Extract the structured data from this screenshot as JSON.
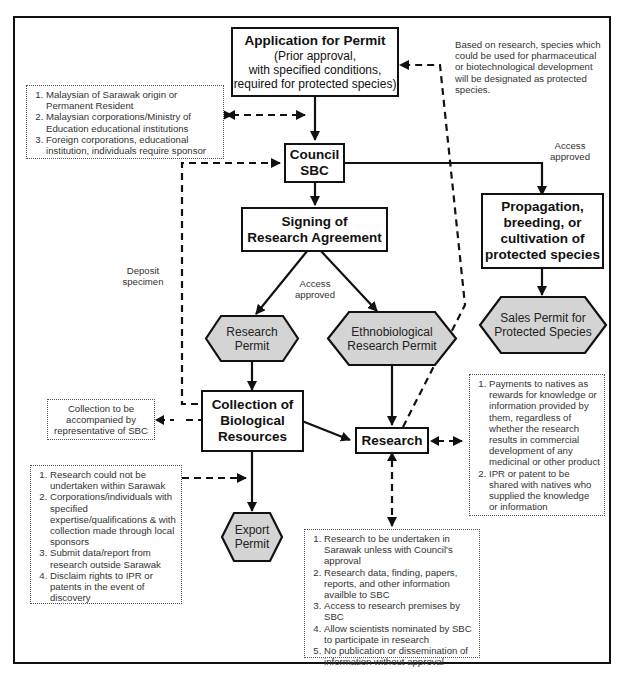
{
  "diagram": {
    "colors": {
      "line": "#111111",
      "hex_fill": "#d4d4d4",
      "note_text": "#333333"
    },
    "nodes": {
      "application": {
        "title": "Application for Permit",
        "subtitle_lines": [
          "(Prior approval,",
          "with specified conditions,",
          "required for protected species)"
        ]
      },
      "council": {
        "line1": "Council",
        "line2": "SBC"
      },
      "signing": {
        "line1": "Signing of",
        "line2": "Research Agreement"
      },
      "propagation": {
        "lines": [
          "Propagation,",
          "breeding, or",
          "cultivation of",
          "protected species"
        ]
      },
      "research_permit": {
        "line1": "Research",
        "line2": "Permit"
      },
      "ethno_permit": {
        "line1": "Ethnobiological",
        "line2": "Research Permit"
      },
      "sales_permit": {
        "line1": "Sales Permit for",
        "line2": "Protected Species"
      },
      "collection": {
        "line1": "Collection of",
        "line2": "Biological",
        "line3": "Resources"
      },
      "research": {
        "label": "Research"
      },
      "export_permit": {
        "line1": "Export",
        "line2": "Permit"
      }
    },
    "labels": {
      "protected_species_note": "Based on research, species which could be used for pharmaceutical or biotechnological development will be designated as protected species.",
      "access_approved_right": {
        "line1": "Access",
        "line2": "approved"
      },
      "access_approved_center": {
        "line1": "Access",
        "line2": "approved"
      },
      "deposit_specimen": {
        "line1": "Deposit",
        "line2": "specimen"
      }
    },
    "notes": {
      "eligibility": [
        "Malaysian of Sarawak origin or Permanent Resident",
        "Malaysian corporations/Ministry of Education educational institutions",
        "Foreign corporations, educational institution, individuals require sponsor"
      ],
      "collection_accompany": {
        "line1": "Collection to be",
        "line2": "accompanied by",
        "line3": "representative of SBC"
      },
      "export_conditions": [
        "Research could not be undertaken within Sarawak",
        "Corporations/individuals with specified expertise/qualifications & with collection made through local sponsors",
        "Submit data/report from research outside Sarawak",
        "Disclaim rights to IPR or patents in the event of discovery"
      ],
      "natives_benefits": [
        "Payments to natives as rewards for knowledge or information provided by them, regardless of whether the research results in commercial development of any medicinal or other product",
        "IPR or patent to be shared with natives who supplied the knowledge or information"
      ],
      "research_conditions": [
        "Research to be undertaken in Sarawak unless with Council's approval",
        "Research data, finding, papers, reports, and other information availble to SBC",
        "Access to research premises by SBC",
        "Allow scientists nominated by SBC to participate in research",
        "No publication or dissemination of information without approval"
      ]
    }
  }
}
